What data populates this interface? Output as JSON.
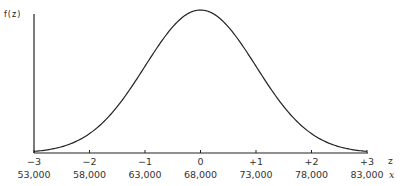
{
  "chart_data": {
    "type": "line",
    "title": "",
    "ylabel": "f(z)",
    "xlabel_primary": "z",
    "xlabel_secondary": "x",
    "z_ticks": [
      "-3",
      "-2",
      "-1",
      "0",
      "+1",
      "+2",
      "+3"
    ],
    "x_ticks": [
      "53,000",
      "58,000",
      "63,000",
      "68,000",
      "73,000",
      "78,000",
      "83,000"
    ],
    "mean": 68000,
    "std_dev": 5000,
    "xlim": [
      -3,
      3
    ],
    "grid": false,
    "legend": null,
    "series": [
      {
        "name": "f(z)",
        "curve": "standard normal density"
      }
    ]
  },
  "axes": {
    "y_label": "f(z)",
    "z_label": "z",
    "x_label": "x"
  }
}
